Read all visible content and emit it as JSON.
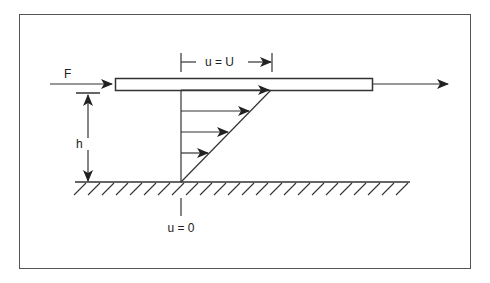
{
  "diagram": {
    "labels": {
      "force": "F",
      "gap_height": "h",
      "top_velocity": "u = U",
      "bottom_velocity": "u = 0"
    },
    "elements": {
      "moving_plate": "Moving plate",
      "fixed_wall": "Fixed wall (hatched ground)",
      "velocity_profile": "Linear velocity profile with 4 arrows",
      "motion_arrow": "Plate motion direction arrow"
    },
    "colors": {
      "stroke": "#333333",
      "frame": "#555555",
      "background": "#ffffff"
    }
  }
}
